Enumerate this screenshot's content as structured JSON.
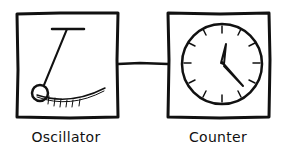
{
  "diagram": {
    "nodes": [
      {
        "id": "oscillator",
        "label": "Oscillator",
        "icon": "pendulum-icon"
      },
      {
        "id": "counter",
        "label": "Counter",
        "icon": "clock-icon"
      }
    ],
    "edges": [
      {
        "from": "oscillator",
        "to": "counter"
      }
    ],
    "colors": {
      "stroke": "#111111",
      "background": "#ffffff"
    }
  }
}
